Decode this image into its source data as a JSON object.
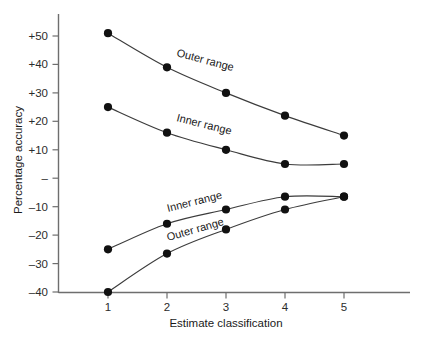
{
  "chart_data": {
    "type": "line",
    "title": "",
    "xlabel": "Estimate classification",
    "ylabel": "Percentage accuracy",
    "x": [
      1,
      2,
      3,
      4,
      5
    ],
    "xticklabels": [
      "1",
      "2",
      "3",
      "4",
      "5"
    ],
    "yticks": [
      50,
      40,
      30,
      20,
      10,
      0,
      -10,
      -20,
      -30,
      -40
    ],
    "yticklabels": [
      "+50",
      "+40",
      "+30",
      "+20",
      "+10",
      "–",
      "–10",
      "–20",
      "–30",
      "–40"
    ],
    "xlim": [
      0.55,
      5.6
    ],
    "ylim": [
      -40,
      55
    ],
    "grid": false,
    "legend": "inline-annotations",
    "series": [
      {
        "name": "Outer range",
        "annotation": "Outer range",
        "position": "upper",
        "values": [
          51,
          39,
          30,
          22,
          15
        ]
      },
      {
        "name": "Inner range",
        "annotation": "Inner range",
        "position": "upper",
        "values": [
          25,
          16,
          10,
          5,
          5
        ]
      },
      {
        "name": "Inner range",
        "annotation": "Inner range",
        "position": "lower",
        "values": [
          -25,
          -16,
          -11,
          -6.5,
          -6.5
        ]
      },
      {
        "name": "Outer range",
        "annotation": "Outer range",
        "position": "lower",
        "values": [
          -40,
          -26.5,
          -18,
          -11,
          -6.5
        ]
      }
    ],
    "colors": {
      "curve": "#3c3c3c",
      "point": "#111111",
      "axis": "#6e6e6e",
      "text": "#1a1a1a",
      "background": "#ffffff"
    }
  },
  "axes": {
    "y_title": "Percentage accuracy",
    "x_title": "Estimate classification",
    "y_tick_labels": [
      "+50",
      "+40",
      "+30",
      "+20",
      "+10",
      "–",
      "–10",
      "–20",
      "–30",
      "–40"
    ],
    "x_tick_labels": [
      "1",
      "2",
      "3",
      "4",
      "5"
    ]
  },
  "annotations": {
    "outer_upper": "Outer range",
    "inner_upper": "Inner range",
    "inner_lower": "Inner range",
    "outer_lower": "Outer range"
  },
  "caption": {
    "partial_text": ""
  }
}
